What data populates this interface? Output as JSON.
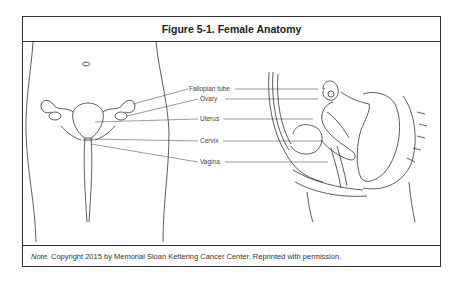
{
  "figure": {
    "title": "Figure 5-1. Female Anatomy",
    "labels": [
      {
        "text": "Fallopian tube"
      },
      {
        "text": "Ovary"
      },
      {
        "text": "Uterus"
      },
      {
        "text": "Cervix"
      },
      {
        "text": "Vagina"
      }
    ],
    "note_prefix": "Note.",
    "note_text": " Copyright 2015 by Memorial Sloan Kettering Cancer Center. Reprinted with permission."
  }
}
